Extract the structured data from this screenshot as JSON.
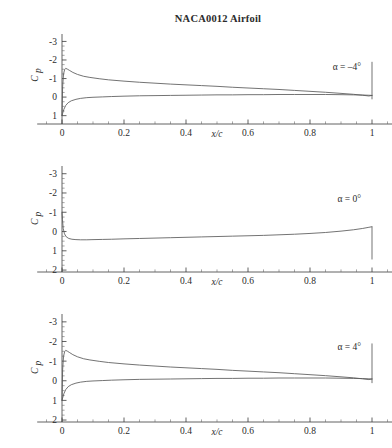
{
  "figure": {
    "title": "NACA0012 Airfoil",
    "background_color": "#ffffff",
    "curve_color": "#5a5a5a",
    "axis_color": "#3a3a3a"
  },
  "axis": {
    "xlabel": "x/c",
    "ylabel": "Cp",
    "ylabel_main": "C",
    "ylabel_sub": "p",
    "xticks": [
      "0",
      "0.2",
      "0.4",
      "0.6",
      "0.8",
      "1"
    ],
    "xtick_values": [
      0,
      0.2,
      0.4,
      0.6,
      0.8,
      1
    ],
    "yticks_top": [
      "-3",
      "-2",
      "-1",
      "0",
      "1"
    ],
    "yticks_full": [
      "-3",
      "-2",
      "-1",
      "0",
      "1",
      "2"
    ]
  },
  "panels": [
    {
      "id": "panel-alpha-neg4",
      "annotation": "α = –4°",
      "alpha_deg": -4,
      "ylim": [
        -3.4,
        1.45
      ],
      "yticks": [
        "-3",
        "-2",
        "-1",
        "0",
        "1"
      ]
    },
    {
      "id": "panel-alpha-0",
      "annotation": "α = 0°",
      "alpha_deg": 0,
      "ylim": [
        -3.4,
        2.1
      ],
      "yticks": [
        "-3",
        "-2",
        "-1",
        "0",
        "1",
        "2"
      ]
    },
    {
      "id": "panel-alpha-4",
      "annotation": "α = 4°",
      "alpha_deg": 4,
      "ylim": [
        -3.4,
        2.1
      ],
      "yticks": [
        "-3",
        "-2",
        "-1",
        "0",
        "1",
        "2"
      ]
    }
  ],
  "chart_data": {
    "type": "line",
    "title": "NACA0012 Airfoil",
    "xlabel": "x/c",
    "ylabel": "Cp",
    "xlim": [
      -0.08,
      1.14
    ],
    "grid": false,
    "legend": false,
    "y_axis_inverted": true,
    "panels": [
      {
        "title": "α = –4°",
        "alpha_deg": -4,
        "ylim": [
          -3.4,
          1.45
        ],
        "yticks": [
          -3,
          -2,
          -1,
          0,
          1
        ],
        "xticks": [
          0,
          0.2,
          0.4,
          0.6,
          0.8,
          1
        ],
        "series": [
          {
            "name": "upper surface",
            "x": [
              0.0,
              0.002,
              0.005,
              0.0085,
              0.012,
              0.018,
              0.025,
              0.035,
              0.05,
              0.07,
              0.09,
              0.12,
              0.15,
              0.2,
              0.25,
              0.3,
              0.35,
              0.4,
              0.45,
              0.5,
              0.55,
              0.6,
              0.65,
              0.7,
              0.75,
              0.8,
              0.85,
              0.9,
              0.94,
              0.97,
              0.99,
              1.0
            ],
            "y": [
              1.0,
              -0.55,
              -1.25,
              -1.48,
              -1.55,
              -1.5,
              -1.43,
              -1.33,
              -1.22,
              -1.12,
              -1.06,
              -0.99,
              -0.93,
              -0.86,
              -0.8,
              -0.75,
              -0.7,
              -0.66,
              -0.62,
              -0.58,
              -0.53,
              -0.49,
              -0.45,
              -0.41,
              -0.36,
              -0.31,
              -0.26,
              -0.2,
              -0.15,
              -0.1,
              -0.06,
              -0.09
            ]
          },
          {
            "name": "lower surface",
            "x": [
              0.0,
              0.002,
              0.006,
              0.012,
              0.02,
              0.03,
              0.045,
              0.06,
              0.08,
              0.1,
              0.13,
              0.16,
              0.2,
              0.25,
              0.3,
              0.35,
              0.4,
              0.45,
              0.5,
              0.55,
              0.6,
              0.65,
              0.7,
              0.75,
              0.8,
              0.85,
              0.9,
              0.94,
              0.97,
              0.99,
              1.0
            ],
            "y": [
              1.0,
              0.88,
              0.66,
              0.45,
              0.3,
              0.2,
              0.12,
              0.07,
              0.03,
              0.01,
              -0.01,
              -0.03,
              -0.05,
              -0.07,
              -0.08,
              -0.09,
              -0.1,
              -0.11,
              -0.12,
              -0.12,
              -0.13,
              -0.13,
              -0.14,
              -0.14,
              -0.14,
              -0.14,
              -0.13,
              -0.12,
              -0.11,
              -0.1,
              -0.09
            ]
          }
        ],
        "closing_line": {
          "x": 1.0,
          "y_from": -1.9,
          "y_to": 0.12
        }
      },
      {
        "title": "α = 0°",
        "alpha_deg": 0,
        "ylim": [
          -3.4,
          2.1
        ],
        "yticks": [
          -3,
          -2,
          -1,
          0,
          1,
          2
        ],
        "xticks": [
          0,
          0.2,
          0.4,
          0.6,
          0.8,
          1
        ],
        "series": [
          {
            "name": "upper and lower surface (coincident)",
            "x": [
              0.0,
              0.0015,
              0.004,
              0.008,
              0.014,
              0.022,
              0.032,
              0.045,
              0.06,
              0.08,
              0.1,
              0.13,
              0.16,
              0.2,
              0.25,
              0.3,
              0.35,
              0.4,
              0.45,
              0.5,
              0.55,
              0.6,
              0.65,
              0.7,
              0.75,
              0.8,
              0.85,
              0.9,
              0.94,
              0.97,
              0.99,
              1.0
            ],
            "y": [
              -1.0,
              -0.62,
              -0.15,
              0.12,
              0.28,
              0.36,
              0.4,
              0.42,
              0.43,
              0.43,
              0.42,
              0.41,
              0.4,
              0.38,
              0.36,
              0.34,
              0.32,
              0.3,
              0.28,
              0.26,
              0.24,
              0.22,
              0.2,
              0.17,
              0.14,
              0.1,
              0.05,
              -0.02,
              -0.09,
              -0.16,
              -0.22,
              -0.25
            ]
          }
        ],
        "closing_line": {
          "x": 1.0,
          "y_from": -0.25,
          "y_to": 1.45
        }
      },
      {
        "title": "α = 4°",
        "alpha_deg": 4,
        "ylim": [
          -3.4,
          2.1
        ],
        "yticks": [
          -3,
          -2,
          -1,
          0,
          1,
          2
        ],
        "xticks": [
          0,
          0.2,
          0.4,
          0.6,
          0.8,
          1
        ],
        "series": [
          {
            "name": "upper surface",
            "x": [
              0.0,
              0.002,
              0.005,
              0.0085,
              0.012,
              0.018,
              0.025,
              0.035,
              0.05,
              0.07,
              0.09,
              0.12,
              0.15,
              0.2,
              0.25,
              0.3,
              0.35,
              0.4,
              0.45,
              0.5,
              0.55,
              0.6,
              0.65,
              0.7,
              0.75,
              0.8,
              0.85,
              0.9,
              0.94,
              0.97,
              0.99,
              1.0
            ],
            "y": [
              1.0,
              -0.55,
              -1.25,
              -1.48,
              -1.55,
              -1.5,
              -1.43,
              -1.33,
              -1.22,
              -1.12,
              -1.06,
              -0.99,
              -0.93,
              -0.86,
              -0.8,
              -0.75,
              -0.7,
              -0.66,
              -0.62,
              -0.58,
              -0.53,
              -0.49,
              -0.45,
              -0.41,
              -0.36,
              -0.31,
              -0.26,
              -0.2,
              -0.15,
              -0.1,
              -0.06,
              -0.09
            ]
          },
          {
            "name": "lower surface",
            "x": [
              0.0,
              0.002,
              0.006,
              0.012,
              0.02,
              0.03,
              0.045,
              0.06,
              0.08,
              0.1,
              0.13,
              0.16,
              0.2,
              0.25,
              0.3,
              0.35,
              0.4,
              0.45,
              0.5,
              0.55,
              0.6,
              0.65,
              0.7,
              0.75,
              0.8,
              0.85,
              0.9,
              0.94,
              0.97,
              0.99,
              1.0
            ],
            "y": [
              1.0,
              0.88,
              0.66,
              0.45,
              0.3,
              0.2,
              0.12,
              0.07,
              0.03,
              0.01,
              -0.01,
              -0.03,
              -0.05,
              -0.07,
              -0.08,
              -0.09,
              -0.1,
              -0.11,
              -0.12,
              -0.12,
              -0.13,
              -0.13,
              -0.14,
              -0.14,
              -0.14,
              -0.14,
              -0.13,
              -0.12,
              -0.11,
              -0.1,
              -0.09
            ]
          }
        ],
        "closing_line": {
          "x": 1.0,
          "y_from": -1.9,
          "y_to": 0.12
        }
      }
    ]
  }
}
